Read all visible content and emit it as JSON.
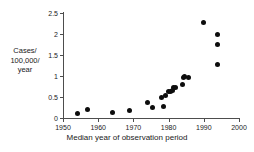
{
  "chart_data": {
    "type": "scatter",
    "title": "",
    "xlabel": "Median year of observation period",
    "ylabel": "Cases/ 100,000/ year",
    "ylabel_lines": [
      "Cases/",
      "100,000/",
      "year"
    ],
    "xlim": [
      1950,
      2000
    ],
    "ylim": [
      0,
      2.5
    ],
    "xticks": [
      1950,
      1960,
      1970,
      1980,
      1990,
      2000
    ],
    "xtick_labels": [
      "1950",
      "1960",
      "1970",
      "1980",
      "1990",
      "2000"
    ],
    "yticks": [
      0,
      0.5,
      1,
      1.5,
      2,
      2.5
    ],
    "ytick_labels": [
      "0",
      "0.5",
      "1",
      "1.5",
      "2",
      "2.5"
    ],
    "grid": false,
    "legend": false,
    "marker": "filled-circle",
    "marker_color": "#0d0d0d",
    "axis_color": "#4d4d4d",
    "points": [
      {
        "x": 1954,
        "y": 0.11
      },
      {
        "x": 1957,
        "y": 0.2
      },
      {
        "x": 1964,
        "y": 0.13
      },
      {
        "x": 1969,
        "y": 0.19
      },
      {
        "x": 1974,
        "y": 0.37
      },
      {
        "x": 1975.5,
        "y": 0.26
      },
      {
        "x": 1978,
        "y": 0.48
      },
      {
        "x": 1978.5,
        "y": 0.27
      },
      {
        "x": 1979,
        "y": 0.53
      },
      {
        "x": 1980,
        "y": 0.62
      },
      {
        "x": 1980.5,
        "y": 0.63
      },
      {
        "x": 1981,
        "y": 0.66
      },
      {
        "x": 1981.5,
        "y": 0.72
      },
      {
        "x": 1982,
        "y": 0.73
      },
      {
        "x": 1984,
        "y": 0.8
      },
      {
        "x": 1984.2,
        "y": 0.96
      },
      {
        "x": 1984.4,
        "y": 0.99
      },
      {
        "x": 1985.6,
        "y": 0.97
      },
      {
        "x": 1990,
        "y": 2.28
      },
      {
        "x": 1994,
        "y": 1.99
      },
      {
        "x": 1994,
        "y": 1.75
      },
      {
        "x": 1994,
        "y": 1.27
      }
    ]
  }
}
